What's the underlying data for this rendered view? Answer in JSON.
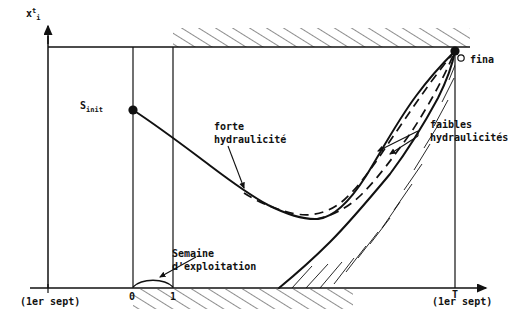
{
  "figure": {
    "kind": "hand-drawn-technical-diagram",
    "language": "fr",
    "background_color": "#ffffff",
    "ink_color": "#111111"
  },
  "axes": {
    "y_axis": {
      "label_base": "x",
      "label_sup": "t",
      "label_sub": "i",
      "x_px": 48,
      "top_px": 32,
      "bottom_px": 288
    },
    "x_axis": {
      "y_px": 288,
      "left_px": 30,
      "right_px": 492,
      "arrow": true
    },
    "ceiling_line": {
      "label": "borne superieure",
      "y_px": 47,
      "left_px": 48,
      "right_px": 470
    }
  },
  "ticks": {
    "x": [
      {
        "name": "tick-0",
        "label": "0",
        "x_px": 133
      },
      {
        "name": "tick-1",
        "label": "1",
        "x_px": 173
      },
      {
        "name": "tick-T",
        "label": "T",
        "x_px": 455
      }
    ],
    "x_captions": [
      {
        "name": "caption-left",
        "text": "(1er sept)",
        "x_px": 22,
        "y_px": 296
      },
      {
        "name": "caption-right",
        "text": "(1er sept)",
        "x_px": 434,
        "y_px": 296
      }
    ]
  },
  "gridlines": [
    {
      "name": "vertical-at-0",
      "x_px": 133,
      "top_px": 47,
      "bottom_px": 288
    },
    {
      "name": "vertical-at-1",
      "x_px": 173,
      "top_px": 47,
      "bottom_px": 288
    },
    {
      "name": "vertical-at-T",
      "x_px": 455,
      "top_px": 47,
      "bottom_px": 288
    }
  ],
  "markers": [
    {
      "name": "s-init-point",
      "label": "S",
      "sub": "init",
      "x_px": 133,
      "y_px": 110,
      "style": "filled-circle"
    },
    {
      "name": "s-final-point",
      "label": "S",
      "sub": "final",
      "x_px": 455,
      "y_px": 51,
      "style": "filled-circle"
    }
  ],
  "labels": [
    {
      "name": "label-s-init",
      "text_base": "S",
      "text_sub": "init",
      "x_px": 82,
      "y_px": 103
    },
    {
      "name": "label-s-final",
      "text": "fina",
      "x_px": 470,
      "y_px": 58,
      "clipped": true
    },
    {
      "name": "label-forte-hydraulicite",
      "line1": "forte",
      "line2": "hydraulicité",
      "x_px": 214,
      "y_px": 124
    },
    {
      "name": "label-faibles-hydraulicites",
      "line1": "faibles",
      "line2": "hydraulicités",
      "x_px": 430,
      "y_px": 122
    },
    {
      "name": "label-semaine-exploitation",
      "line1": "Semaine",
      "line2": "d'exploitation",
      "x_px": 172,
      "y_px": 251
    }
  ],
  "curves": [
    {
      "name": "trajectory-forte-hydraulicite",
      "style": "solid",
      "meaning": "forte hydraulicité",
      "points": [
        [
          133,
          110
        ],
        [
          160,
          128
        ],
        [
          192,
          152
        ],
        [
          222,
          174
        ],
        [
          248,
          190
        ],
        [
          268,
          205
        ],
        [
          290,
          216
        ],
        [
          312,
          219
        ],
        [
          332,
          211
        ],
        [
          352,
          192
        ],
        [
          372,
          164
        ],
        [
          394,
          128
        ],
        [
          420,
          92
        ],
        [
          440,
          68
        ],
        [
          455,
          51
        ]
      ]
    },
    {
      "name": "trajectory-lower-boundary",
      "style": "solid",
      "meaning": "borne inferieure de faisabilite",
      "points": [
        [
          279,
          288
        ],
        [
          300,
          272
        ],
        [
          322,
          252
        ],
        [
          344,
          230
        ],
        [
          366,
          206
        ],
        [
          388,
          179
        ],
        [
          408,
          152
        ],
        [
          426,
          124
        ],
        [
          442,
          94
        ],
        [
          452,
          68
        ],
        [
          455,
          51
        ]
      ]
    },
    {
      "name": "trajectory-faible-1",
      "style": "dashed",
      "meaning": "faible hydraulicité (haute)",
      "points": [
        [
          244,
          193
        ],
        [
          268,
          206
        ],
        [
          292,
          214
        ],
        [
          316,
          213
        ],
        [
          338,
          202
        ],
        [
          358,
          184
        ],
        [
          378,
          158
        ],
        [
          398,
          130
        ],
        [
          418,
          104
        ],
        [
          436,
          78
        ],
        [
          455,
          51
        ]
      ]
    },
    {
      "name": "trajectory-faible-2",
      "style": "dashed",
      "meaning": "faible hydraulicité (basse)",
      "points": [
        [
          318,
          218
        ],
        [
          338,
          212
        ],
        [
          358,
          200
        ],
        [
          378,
          182
        ],
        [
          398,
          158
        ],
        [
          416,
          134
        ],
        [
          432,
          110
        ],
        [
          444,
          84
        ],
        [
          455,
          51
        ]
      ]
    }
  ],
  "hatching": [
    {
      "name": "hatch-upper-infeasible",
      "position": "above-ceiling-line",
      "from_px": 173,
      "to_px": 470,
      "angle_deg": -60
    },
    {
      "name": "hatch-lower-axis",
      "position": "below-x-axis",
      "from_px": 133,
      "to_px": 350,
      "angle_deg": -60
    },
    {
      "name": "hatch-lower-boundary",
      "position": "right-of-lower-curve",
      "angle_deg": -60
    }
  ],
  "annotations": [
    {
      "name": "arrow-forte",
      "from": [
        228,
        144
      ],
      "to": [
        244,
        190
      ],
      "target": "dashed upper branch"
    },
    {
      "name": "arrow-faibles-upper",
      "from": [
        420,
        132
      ],
      "to": [
        380,
        155
      ],
      "target": "trajectory-faible-1"
    },
    {
      "name": "arrow-faibles-lower",
      "from": [
        420,
        134
      ],
      "to": [
        392,
        152
      ],
      "target": "trajectory-faible-2"
    },
    {
      "name": "brace-semaine",
      "from_px": 133,
      "to_px": 173,
      "y_px": 284,
      "kind": "curved-brace"
    },
    {
      "name": "arrow-semaine",
      "from": [
        196,
        258
      ],
      "to": [
        160,
        278
      ],
      "target": "brace-semaine"
    }
  ]
}
